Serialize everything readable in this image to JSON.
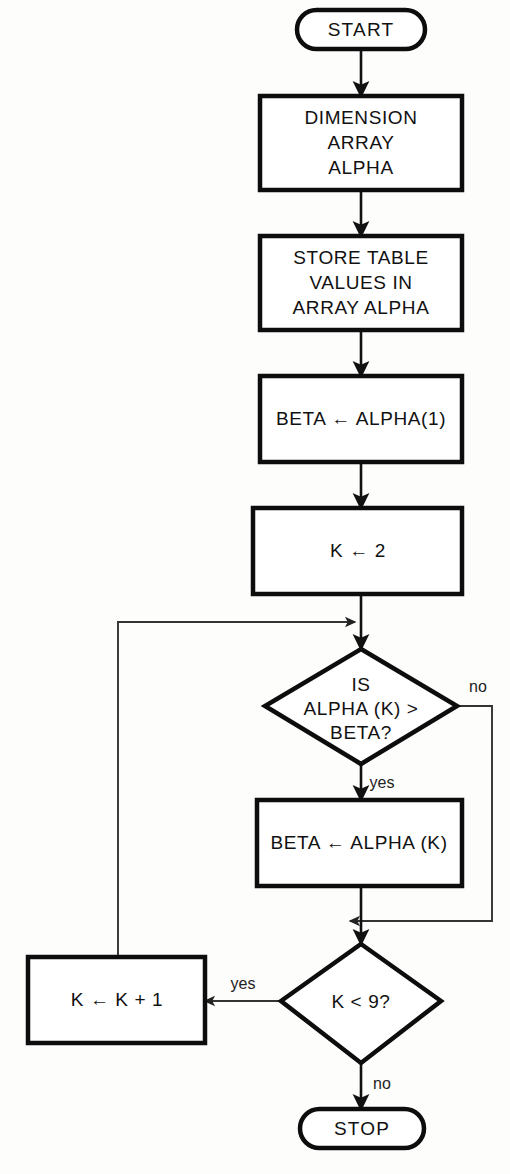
{
  "diagram": {
    "colors": {
      "stroke": "#0d0d0d",
      "background": "#fdfdfc",
      "text": "#111111",
      "line": "#111111"
    },
    "nodes": [
      {
        "id": "start",
        "type": "terminator",
        "lines": [
          "START"
        ]
      },
      {
        "id": "dimension",
        "type": "process",
        "lines": [
          "DIMENSION",
          "ARRAY",
          "ALPHA"
        ]
      },
      {
        "id": "store",
        "type": "process",
        "lines": [
          "STORE TABLE",
          "VALUES IN",
          "ARRAY ALPHA"
        ]
      },
      {
        "id": "beta-init",
        "type": "process",
        "lines": [
          "BETA ← ALPHA(1)"
        ]
      },
      {
        "id": "k-init",
        "type": "process",
        "lines": [
          "K ← 2"
        ]
      },
      {
        "id": "compare",
        "type": "decision",
        "lines": [
          "IS",
          "ALPHA (K) >",
          "BETA?"
        ]
      },
      {
        "id": "beta-update",
        "type": "process",
        "lines": [
          "BETA ← ALPHA (K)"
        ]
      },
      {
        "id": "k-test",
        "type": "decision",
        "lines": [
          "K < 9?"
        ]
      },
      {
        "id": "k-increment",
        "type": "process",
        "lines": [
          "K ← K + 1"
        ]
      },
      {
        "id": "stop",
        "type": "terminator",
        "lines": [
          "STOP"
        ]
      }
    ],
    "edge_labels": {
      "compare_no": "no",
      "compare_yes": "yes",
      "ktest_yes": "yes",
      "ktest_no": "no"
    }
  }
}
